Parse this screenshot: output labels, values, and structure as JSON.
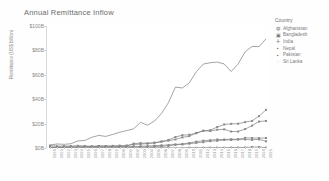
{
  "chart_data": {
    "type": "line",
    "title": "Annual Remittance Inflow",
    "xlabel": "",
    "ylabel": "Remittance (US$ billion)",
    "ylim": [
      0,
      100
    ],
    "yticks": [
      "$0B",
      "$20B",
      "$40B",
      "$60B",
      "$80B",
      "$100B"
    ],
    "grid": false,
    "legend_position": "right",
    "legend_title": "Country",
    "x": [
      "1990",
      "1991",
      "1992",
      "1993",
      "1994",
      "1995",
      "1996",
      "1997",
      "1998",
      "1999",
      "2000",
      "2001",
      "2002",
      "2003",
      "2004",
      "2005",
      "2006",
      "2007",
      "2008",
      "2009",
      "2010",
      "2011",
      "2012",
      "2013",
      "2014",
      "2015",
      "2016",
      "2017",
      "2018",
      "2019",
      "2020",
      "2021"
    ],
    "series": [
      {
        "name": "Afghanistan",
        "marker": "circle",
        "values": [
          0.0,
          0.0,
          0.0,
          0.0,
          0.0,
          0.0,
          0.0,
          0.0,
          0.0,
          0.0,
          0.0,
          0.0,
          0.0,
          0.1,
          0.2,
          0.3,
          0.3,
          0.1,
          0.1,
          0.1,
          0.3,
          0.2,
          0.3,
          0.3,
          0.3,
          0.3,
          0.4,
          0.4,
          0.4,
          0.8,
          0.8,
          0.3
        ]
      },
      {
        "name": "Bangladesh",
        "marker": "square",
        "values": [
          0.8,
          0.8,
          0.9,
          1.0,
          1.1,
          1.2,
          1.2,
          1.5,
          1.6,
          1.8,
          2.0,
          2.1,
          2.9,
          3.2,
          3.6,
          4.3,
          5.4,
          6.6,
          9.0,
          10.5,
          10.9,
          12.1,
          14.2,
          13.9,
          15.0,
          15.3,
          13.5,
          13.5,
          15.5,
          18.3,
          21.7,
          22.2
        ]
      },
      {
        "name": "India",
        "marker": "plus",
        "values": [
          2.4,
          3.3,
          3.0,
          3.5,
          5.8,
          6.2,
          8.8,
          10.3,
          9.5,
          11.1,
          12.9,
          14.3,
          15.7,
          21.0,
          18.7,
          22.1,
          28.3,
          37.2,
          49.9,
          49.2,
          53.4,
          62.5,
          68.8,
          69.9,
          70.4,
          68.9,
          62.7,
          68.9,
          78.8,
          83.3,
          83.1,
          89.4
        ]
      },
      {
        "name": "Nepal",
        "marker": "square-filled",
        "values": [
          0.0,
          0.0,
          0.0,
          0.0,
          0.0,
          0.1,
          0.1,
          0.1,
          0.1,
          0.1,
          0.1,
          0.1,
          0.7,
          0.8,
          0.8,
          1.2,
          1.5,
          1.7,
          2.7,
          2.9,
          3.5,
          4.2,
          4.8,
          5.6,
          5.9,
          6.7,
          6.6,
          6.9,
          8.3,
          8.2,
          8.1,
          8.2
        ]
      },
      {
        "name": "Pakistan",
        "marker": "square-small",
        "values": [
          2.0,
          1.5,
          1.6,
          1.6,
          1.8,
          1.7,
          1.4,
          1.7,
          1.5,
          1.1,
          1.1,
          1.5,
          3.6,
          4.0,
          3.9,
          4.3,
          5.1,
          6.0,
          7.0,
          8.7,
          9.7,
          12.3,
          14.0,
          14.6,
          17.2,
          19.3,
          19.8,
          19.9,
          21.2,
          22.2,
          26.1,
          31.3
        ]
      },
      {
        "name": "Sri Lanka",
        "marker": "circle-open",
        "values": [
          0.4,
          0.4,
          0.5,
          0.6,
          0.7,
          0.8,
          0.8,
          0.9,
          1.0,
          1.0,
          1.2,
          1.1,
          1.3,
          1.4,
          1.6,
          1.9,
          2.2,
          2.5,
          2.9,
          3.3,
          4.1,
          5.2,
          6.0,
          6.4,
          7.0,
          6.9,
          7.2,
          7.2,
          7.0,
          6.7,
          7.1,
          5.5
        ]
      }
    ]
  },
  "legend": {
    "title": "Country",
    "items": [
      {
        "label": "Afghanistan",
        "glyph": "◍"
      },
      {
        "label": "Bangladesh",
        "glyph": "▣"
      },
      {
        "label": "India",
        "glyph": "✛"
      },
      {
        "label": "Nepal",
        "glyph": "▪"
      },
      {
        "label": "Pakistan",
        "glyph": "▪"
      },
      {
        "label": "Sri Lanka",
        "glyph": "◌"
      }
    ]
  },
  "colors": {
    "line": "#7d7d7d",
    "text": "#7b7b7b",
    "axis": "#d0d0d0"
  }
}
